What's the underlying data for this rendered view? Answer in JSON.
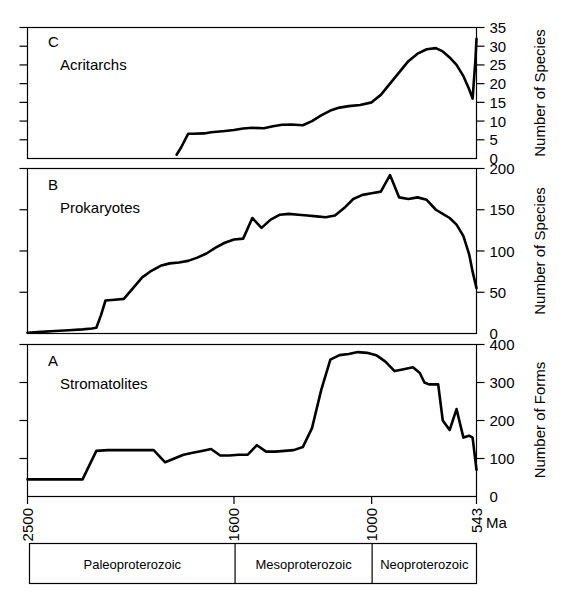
{
  "figure": {
    "x_axis": {
      "label": "Ma",
      "ticks": [
        2500,
        1600,
        1000,
        543
      ],
      "tick_labels": [
        "2500",
        "1600",
        "1000",
        "543"
      ],
      "range": [
        2500,
        543
      ],
      "direction": "decreasing"
    },
    "eras": [
      {
        "label": "Paleoproterozoic",
        "start": 2500,
        "end": 1600
      },
      {
        "label": "Mesoproterozoic",
        "start": 1600,
        "end": 1000
      },
      {
        "label": "Neoproterozoic",
        "start": 1000,
        "end": 543
      }
    ]
  },
  "panels": [
    {
      "letter": "C",
      "name": "Acritarchs",
      "ylabel": "Number of Species",
      "yticks": [
        0,
        5,
        10,
        15,
        20,
        25,
        30,
        35
      ],
      "ytick_labels": [
        "0",
        "5",
        "10",
        "15",
        "20",
        "25",
        "30",
        "35"
      ]
    },
    {
      "letter": "B",
      "name": "Prokaryotes",
      "ylabel": "Number of Species",
      "yticks": [
        0,
        50,
        100,
        150,
        200
      ],
      "ytick_labels": [
        "0",
        "50",
        "100",
        "150",
        "200"
      ]
    },
    {
      "letter": "A",
      "name": "Stromatolites",
      "ylabel": "Number of Forms",
      "yticks": [
        0,
        100,
        200,
        300,
        400
      ],
      "ytick_labels": [
        "0",
        "100",
        "200",
        "300",
        "400"
      ]
    }
  ],
  "chart_data": [
    {
      "type": "line",
      "title": "C  Acritarchs",
      "xlabel": "Ma",
      "ylabel": "Number of Species",
      "xlim": [
        2500,
        543
      ],
      "ylim": [
        0,
        35
      ],
      "grid": false,
      "legend": "none",
      "x": [
        1850,
        1830,
        1800,
        1780,
        1730,
        1700,
        1650,
        1600,
        1560,
        1520,
        1470,
        1430,
        1390,
        1350,
        1300,
        1260,
        1220,
        1180,
        1140,
        1100,
        1050,
        1000,
        960,
        920,
        880,
        840,
        800,
        760,
        720,
        690,
        660,
        630,
        600,
        575,
        560,
        548,
        543
      ],
      "y": [
        1,
        3,
        6.6,
        6.6,
        6.7,
        7.0,
        7.3,
        7.6,
        8.0,
        8.2,
        8.1,
        8.6,
        9.0,
        9.1,
        8.9,
        10.0,
        11.5,
        12.8,
        13.6,
        14.0,
        14.3,
        15.0,
        17.0,
        20.0,
        23.0,
        26.0,
        28.0,
        29.2,
        29.5,
        28.6,
        27.0,
        25.0,
        22.0,
        18.5,
        16.0,
        26.0,
        32.0
      ]
    },
    {
      "type": "line",
      "title": "B  Prokaryotes",
      "xlabel": "Ma",
      "ylabel": "Number of Species",
      "xlim": [
        2500,
        543
      ],
      "ylim": [
        0,
        200
      ],
      "grid": false,
      "legend": "none",
      "x": [
        2500,
        2440,
        2380,
        2320,
        2260,
        2220,
        2200,
        2180,
        2160,
        2120,
        2080,
        2040,
        2000,
        1960,
        1920,
        1880,
        1840,
        1800,
        1760,
        1720,
        1680,
        1640,
        1600,
        1560,
        1520,
        1480,
        1440,
        1400,
        1360,
        1320,
        1280,
        1240,
        1200,
        1160,
        1120,
        1080,
        1040,
        1000,
        960,
        920,
        880,
        840,
        800,
        760,
        720,
        690,
        660,
        630,
        600,
        575,
        560,
        543
      ],
      "y": [
        1,
        2,
        3,
        4,
        5,
        6,
        7,
        22,
        40,
        41,
        42,
        55,
        68,
        76,
        82,
        85,
        86,
        88,
        92,
        97,
        104,
        110,
        114,
        115,
        140,
        128,
        138,
        144,
        145,
        144,
        143,
        142,
        141,
        143,
        152,
        163,
        168,
        170,
        172,
        192,
        165,
        163,
        165,
        162,
        150,
        145,
        140,
        132,
        118,
        96,
        75,
        55
      ]
    },
    {
      "type": "line",
      "title": "A  Stromatolites",
      "xlabel": "Ma",
      "ylabel": "Number of Forms",
      "xlim": [
        2500,
        543
      ],
      "ylim": [
        0,
        400
      ],
      "grid": false,
      "legend": "none",
      "x": [
        2500,
        2400,
        2300,
        2260,
        2200,
        2150,
        2100,
        2050,
        2000,
        1950,
        1900,
        1860,
        1820,
        1780,
        1740,
        1700,
        1660,
        1620,
        1580,
        1540,
        1500,
        1460,
        1420,
        1380,
        1340,
        1300,
        1260,
        1220,
        1180,
        1140,
        1100,
        1060,
        1020,
        980,
        940,
        900,
        860,
        820,
        790,
        770,
        750,
        730,
        710,
        690,
        660,
        630,
        600,
        575,
        560,
        543
      ],
      "y": [
        45,
        45,
        45,
        45,
        120,
        122,
        122,
        122,
        122,
        122,
        90,
        100,
        110,
        115,
        120,
        125,
        108,
        108,
        110,
        110,
        135,
        118,
        118,
        120,
        122,
        130,
        180,
        280,
        360,
        372,
        375,
        380,
        378,
        372,
        355,
        330,
        335,
        340,
        325,
        300,
        295,
        295,
        295,
        200,
        175,
        230,
        155,
        160,
        155,
        70
      ]
    }
  ]
}
